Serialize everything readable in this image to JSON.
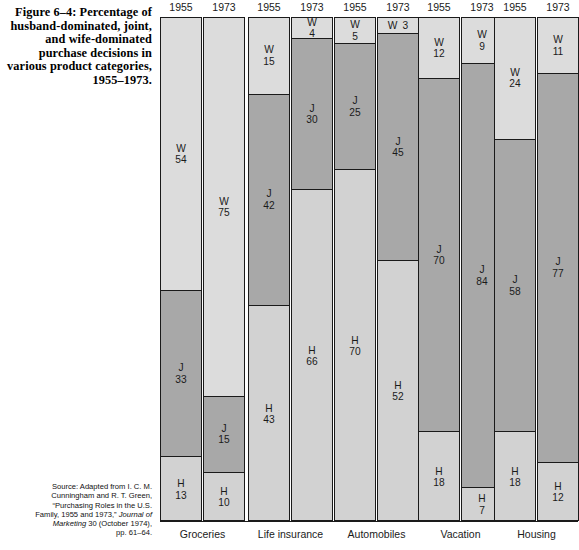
{
  "caption": {
    "text": "Figure 6–4: Percentage of husband-dominated, joint, and wife-dominated purchase decisions in various product categories, 1955–1973."
  },
  "source": {
    "line1": "Source: Adapted from I. C. M.",
    "line2": "Cunningham and R. T. Green,",
    "line3": "“Purchasing Roles in the U.S.",
    "line4_a": "Family, 1955 and 1973,” ",
    "line4_b": "Journal of",
    "line5_a": "Marketing",
    "line5_b": " 30 (October 1974),",
    "line6": "pp. 61–64."
  },
  "chart_data": {
    "type": "bar",
    "subtype": "stacked-100-percent",
    "title": "Figure 6–4: Percentage of husband-dominated, joint, and wife-dominated purchase decisions in various product categories, 1955–1973.",
    "xlabel": "",
    "ylabel": "",
    "ylim": [
      0,
      100
    ],
    "grid": false,
    "legend": "none",
    "segment_keys": {
      "W": "Wife-dominated",
      "J": "Joint",
      "H": "Husband-dominated"
    },
    "segment_colors": {
      "W": "#dcdcdc",
      "J": "#a8a8a8",
      "H": "#d2d2d2"
    },
    "categories": [
      "Groceries",
      "Life insurance",
      "Automobiles",
      "Vacation",
      "Housing"
    ],
    "years": [
      "1955",
      "1973"
    ],
    "groups": [
      {
        "category": "Groceries",
        "bars": [
          {
            "year": "1955",
            "segments": [
              {
                "key": "W",
                "label": "W",
                "value": 54
              },
              {
                "key": "J",
                "label": "J",
                "value": 33
              },
              {
                "key": "H",
                "label": "H",
                "value": 13
              }
            ]
          },
          {
            "year": "1973",
            "segments": [
              {
                "key": "W",
                "label": "W",
                "value": 75
              },
              {
                "key": "J",
                "label": "J",
                "value": 15
              },
              {
                "key": "H",
                "label": "H",
                "value": 10
              }
            ]
          }
        ]
      },
      {
        "category": "Life insurance",
        "bars": [
          {
            "year": "1955",
            "segments": [
              {
                "key": "W",
                "label": "W",
                "value": 15
              },
              {
                "key": "J",
                "label": "J",
                "value": 42
              },
              {
                "key": "H",
                "label": "H",
                "value": 43
              }
            ]
          },
          {
            "year": "1973",
            "segments": [
              {
                "key": "W",
                "label": "W",
                "value": 4
              },
              {
                "key": "J",
                "label": "J",
                "value": 30
              },
              {
                "key": "H",
                "label": "H",
                "value": 66
              }
            ]
          }
        ]
      },
      {
        "category": "Automobiles",
        "bars": [
          {
            "year": "1955",
            "segments": [
              {
                "key": "W",
                "label": "W",
                "value": 5
              },
              {
                "key": "J",
                "label": "J",
                "value": 25
              },
              {
                "key": "H",
                "label": "H",
                "value": 70
              }
            ]
          },
          {
            "year": "1973",
            "segments": [
              {
                "key": "W",
                "label": "W",
                "value": 3,
                "inline": true
              },
              {
                "key": "J",
                "label": "J",
                "value": 45
              },
              {
                "key": "H",
                "label": "H",
                "value": 52
              }
            ]
          }
        ]
      },
      {
        "category": "Vacation",
        "bars": [
          {
            "year": "1955",
            "segments": [
              {
                "key": "W",
                "label": "W",
                "value": 12
              },
              {
                "key": "J",
                "label": "J",
                "value": 70
              },
              {
                "key": "H",
                "label": "H",
                "value": 18
              }
            ]
          },
          {
            "year": "1973",
            "segments": [
              {
                "key": "W",
                "label": "W",
                "value": 9
              },
              {
                "key": "J",
                "label": "J",
                "value": 84
              },
              {
                "key": "H",
                "label": "H",
                "value": 7
              }
            ]
          }
        ]
      },
      {
        "category": "Housing",
        "bars": [
          {
            "year": "1955",
            "segments": [
              {
                "key": "W",
                "label": "W",
                "value": 24
              },
              {
                "key": "J",
                "label": "J",
                "value": 58
              },
              {
                "key": "H",
                "label": "H",
                "value": 18
              }
            ]
          },
          {
            "year": "1973",
            "segments": [
              {
                "key": "W",
                "label": "W",
                "value": 11
              },
              {
                "key": "J",
                "label": "J",
                "value": 77
              },
              {
                "key": "H",
                "label": "H",
                "value": 12
              }
            ]
          }
        ]
      }
    ]
  },
  "layout": {
    "plot_top": 17,
    "plot_bottom": 521,
    "group_x": [
      0,
      88,
      174,
      258,
      334
    ],
    "bar_width": 42,
    "bar_gap": 1,
    "group_width": 85
  }
}
